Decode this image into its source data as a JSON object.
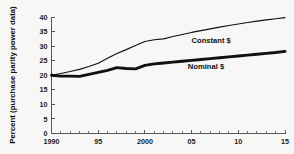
{
  "chart_data": {
    "type": "line",
    "title": "",
    "subtitle": "",
    "xlabel": "",
    "ylabel": "Percent (purchase parity power data)",
    "xlim": [
      1990,
      2015
    ],
    "ylim": [
      0,
      40
    ],
    "grid": false,
    "legend_position": "inline-annotations",
    "y_ticks": [
      "0",
      "5",
      "10",
      "15",
      "20",
      "25",
      "30",
      "35",
      "40"
    ],
    "y_tick_values": [
      0,
      5,
      10,
      15,
      20,
      25,
      30,
      35,
      40
    ],
    "x_ticks": [
      "1990",
      "95",
      "2000",
      "05",
      "10",
      "15"
    ],
    "x_tick_values": [
      1990,
      1995,
      2000,
      2005,
      2010,
      2015
    ],
    "x_minor_step": 1,
    "x": [
      1990,
      1991,
      1992,
      1993,
      1994,
      1995,
      1996,
      1997,
      1998,
      1999,
      2000,
      2001,
      2002,
      2003,
      2004,
      2005,
      2006,
      2007,
      2008,
      2009,
      2010,
      2011,
      2012,
      2013,
      2014,
      2015
    ],
    "series": [
      {
        "name": "Constant $",
        "label": "Constant $",
        "style": "thin",
        "color": "#111111",
        "values": [
          20.0,
          20.6,
          21.3,
          22.0,
          23.0,
          24.1,
          25.8,
          27.5,
          28.8,
          30.2,
          31.6,
          32.2,
          32.5,
          33.3,
          34.0,
          34.7,
          35.3,
          35.9,
          36.5,
          37.1,
          37.6,
          38.1,
          38.6,
          39.0,
          39.4,
          39.8
        ]
      },
      {
        "name": "Nominal $",
        "label": "Nominal $",
        "style": "thick",
        "color": "#111111",
        "values": [
          20.0,
          19.7,
          19.7,
          19.6,
          20.3,
          21.0,
          21.7,
          22.6,
          22.3,
          22.2,
          23.4,
          23.9,
          24.2,
          24.5,
          24.8,
          25.1,
          25.4,
          25.7,
          26.0,
          26.3,
          26.6,
          26.9,
          27.2,
          27.5,
          27.8,
          28.2
        ]
      }
    ],
    "annotations": [
      {
        "text": "Constant $",
        "x": 2005.0,
        "y": 31.0
      },
      {
        "text": "Nominal $",
        "x": 2004.6,
        "y": 22.3
      }
    ]
  }
}
